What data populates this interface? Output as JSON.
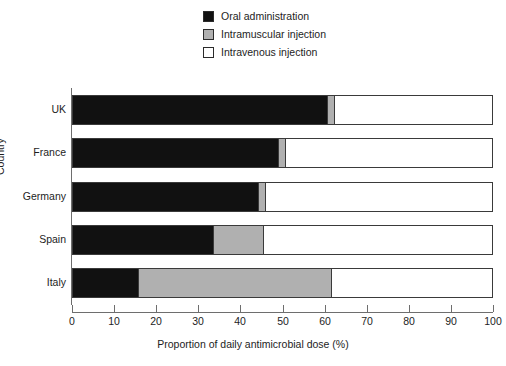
{
  "chart_data": {
    "type": "bar",
    "orientation": "horizontal",
    "stacked": true,
    "stack_mode": "percent",
    "title": "",
    "xlabel": "Proportion of daily antimicrobial dose (%)",
    "ylabel": "Country",
    "xlim": [
      0,
      100
    ],
    "xticks": [
      0,
      10,
      20,
      30,
      40,
      50,
      60,
      70,
      80,
      90,
      100
    ],
    "xtick_labels": [
      "0",
      "10",
      "20",
      "30",
      "40",
      "50",
      "60",
      "70",
      "80",
      "90",
      "100"
    ],
    "grid": false,
    "legend_position": "top-right",
    "categories": [
      "UK",
      "France",
      "Germany",
      "Spain",
      "Italy"
    ],
    "series": [
      {
        "name": "Oral administration",
        "color": "#111111",
        "values": [
          60.6,
          48.9,
          44.2,
          33.5,
          15.4
        ]
      },
      {
        "name": "Intramuscular injection",
        "color": "#b0b0b0",
        "values": [
          1.6,
          1.7,
          1.6,
          11.9,
          46.1
        ]
      },
      {
        "name": "Intravenous injection",
        "color": "#ffffff",
        "values": [
          37.8,
          49.4,
          54.2,
          54.6,
          38.5
        ]
      }
    ]
  },
  "legend": {
    "items": [
      {
        "label": "Oral administration",
        "color": "#111111"
      },
      {
        "label": "Intramuscular injection",
        "color": "#b0b0b0"
      },
      {
        "label": "Intravenous injection",
        "color": "#ffffff"
      }
    ]
  },
  "axes": {
    "x_title": "Proportion of daily antimicrobial dose (%)",
    "y_title": "Country"
  }
}
